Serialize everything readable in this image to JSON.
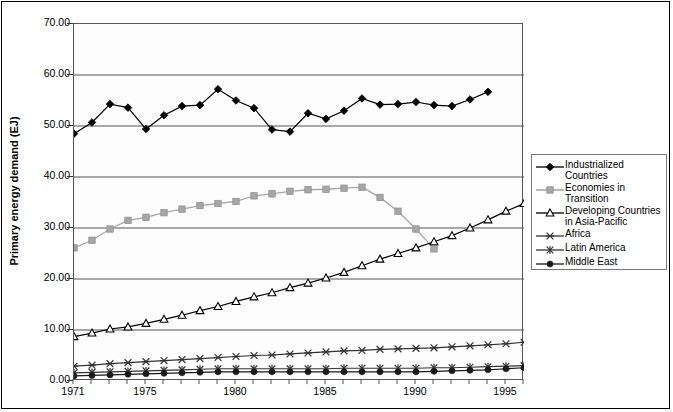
{
  "chart_data": {
    "type": "line",
    "title": "",
    "xlabel": "",
    "ylabel": "Primary energy demand (EJ)",
    "xlim": [
      1971,
      1996
    ],
    "ylim": [
      0,
      70
    ],
    "yticks": [
      "0.00",
      "10.00",
      "20.00",
      "30.00",
      "40.00",
      "50.00",
      "60.00",
      "70.00"
    ],
    "ytick_values": [
      0,
      10,
      20,
      30,
      40,
      50,
      60,
      70
    ],
    "xticks": [
      "1971",
      "1975",
      "1980",
      "1985",
      "1990",
      "1995"
    ],
    "xtick_values": [
      1971,
      1975,
      1980,
      1985,
      1990,
      1995
    ],
    "grid": "horizontal",
    "legend_position": "right-outside",
    "x": [
      1971,
      1972,
      1973,
      1974,
      1975,
      1976,
      1977,
      1978,
      1979,
      1980,
      1981,
      1982,
      1983,
      1984,
      1985,
      1986,
      1987,
      1988,
      1989,
      1990,
      1991,
      1992,
      1993,
      1994,
      1995,
      1996
    ],
    "series": [
      {
        "name": "Industrialized Countries",
        "marker": "filled-diamond",
        "color": "#000000",
        "values": [
          48.5,
          50.7,
          54.3,
          53.6,
          49.4,
          52.1,
          53.9,
          54.1,
          57.2,
          55.0,
          53.5,
          49.3,
          48.9,
          52.5,
          51.4,
          53.0,
          55.4,
          54.2,
          54.3,
          54.7,
          54.1,
          53.9,
          55.2,
          56.7,
          0,
          0
        ]
      },
      {
        "name": "Economies in Transition",
        "marker": "filled-square",
        "color": "#a6a6a6",
        "values": [
          26.1,
          27.6,
          29.8,
          31.5,
          32.1,
          33.0,
          33.7,
          34.4,
          34.8,
          35.2,
          36.3,
          36.7,
          37.2,
          37.5,
          37.6,
          37.8,
          38.0,
          36.0,
          33.3,
          29.8,
          25.9,
          0,
          0,
          0,
          0,
          0
        ]
      },
      {
        "name": "Developing Countries\nin Asia-Pacific",
        "marker": "open-triangle",
        "color": "#000000",
        "values": [
          8.7,
          9.4,
          10.2,
          10.6,
          11.3,
          12.1,
          12.9,
          13.8,
          14.6,
          15.6,
          16.5,
          17.3,
          18.3,
          19.2,
          20.2,
          21.3,
          22.6,
          23.9,
          25.0,
          26.1,
          27.3,
          28.5,
          30.0,
          31.6,
          33.3,
          34.8
        ]
      },
      {
        "name": "Africa",
        "marker": "star-x",
        "color": "#333333",
        "values": [
          2.9,
          3.1,
          3.4,
          3.6,
          3.8,
          4.0,
          4.2,
          4.4,
          4.6,
          4.8,
          5.0,
          5.1,
          5.3,
          5.5,
          5.7,
          5.9,
          6.0,
          6.2,
          6.3,
          6.4,
          6.5,
          6.7,
          6.9,
          7.1,
          7.3,
          7.6
        ]
      },
      {
        "name": "Latin America",
        "marker": "asterisk",
        "color": "#333333",
        "values": [
          1.6,
          1.7,
          1.8,
          1.9,
          2.0,
          2.1,
          2.2,
          2.3,
          2.4,
          2.4,
          2.4,
          2.4,
          2.4,
          2.4,
          2.4,
          2.5,
          2.5,
          2.5,
          2.5,
          2.5,
          2.6,
          2.6,
          2.7,
          2.8,
          2.9,
          3.0
        ]
      },
      {
        "name": "Middle East",
        "marker": "filled-circle",
        "color": "#1a1a1a",
        "values": [
          1.0,
          1.1,
          1.2,
          1.3,
          1.4,
          1.5,
          1.6,
          1.7,
          1.8,
          1.8,
          1.8,
          1.8,
          1.8,
          1.8,
          1.8,
          1.8,
          1.8,
          1.8,
          1.8,
          1.8,
          1.9,
          2.0,
          2.1,
          2.2,
          2.4,
          2.6
        ]
      }
    ]
  },
  "legend": {
    "items": [
      {
        "label": "Industrialized Countries",
        "marker": "filled-diamond",
        "color": "#000000"
      },
      {
        "label": "Economies in Transition",
        "marker": "filled-square",
        "color": "#a6a6a6"
      },
      {
        "label": "Developing Countries\nin Asia-Pacific",
        "marker": "open-triangle",
        "color": "#000000"
      },
      {
        "label": "Africa",
        "marker": "star-x",
        "color": "#333333"
      },
      {
        "label": "Latin America",
        "marker": "asterisk",
        "color": "#333333"
      },
      {
        "label": "Middle East",
        "marker": "filled-circle",
        "color": "#1a1a1a"
      }
    ]
  }
}
